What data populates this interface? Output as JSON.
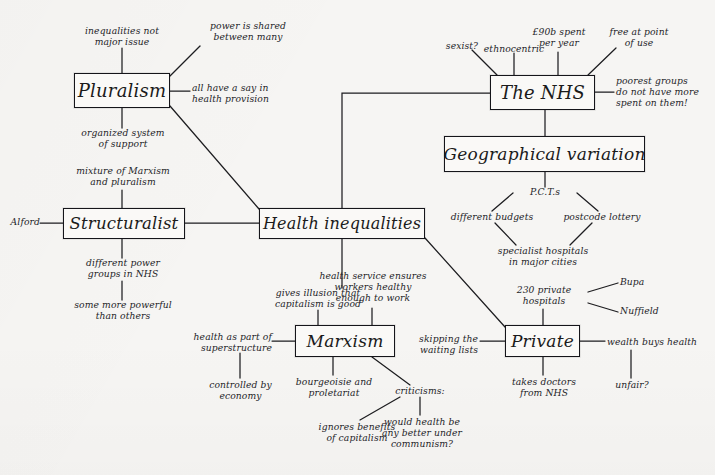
{
  "palette": {
    "paper": "#f6f5f3",
    "ink": "#1b1b1b",
    "box_fill": "#faf9f7",
    "box_border": "#15151a"
  },
  "boxes": [
    {
      "id": "pluralism",
      "label": "Pluralism"
    },
    {
      "id": "structuralist",
      "label": "Structuralist"
    },
    {
      "id": "health",
      "label": "Health inequalities"
    },
    {
      "id": "nhs",
      "label": "The NHS"
    },
    {
      "id": "geographical",
      "label": "Geographical variation"
    },
    {
      "id": "marxism",
      "label": "Marxism"
    },
    {
      "id": "private",
      "label": "Private"
    }
  ],
  "notes": {
    "inequalities_not_major": "inequalities not\nmajor issue",
    "power_shared": "power is shared\nbetween many",
    "all_have_say": "all have a say in\nhealth provision",
    "organized_system": "organized system\nof support",
    "mixture_marxism": "mixture of Marxism\nand pluralism",
    "alford": "Alford",
    "different_power_groups": "different power\ngroups in NHS",
    "some_more_powerful": "some more powerful\nthan others",
    "sexist": "sexist?",
    "ethnocentric": "ethnocentric",
    "spend_per_year": "£90b spent\nper year",
    "free_at_point": "free at point\nof use",
    "poorest_groups": "poorest groups\ndo not have more\nspent on them!",
    "pcts": "P.C.T.s",
    "different_budgets": "different budgets",
    "postcode_lottery": "postcode lottery",
    "specialist_hospitals": "specialist hospitals\nin major cities",
    "private_hospitals": "230 private\nhospitals",
    "bupa": "Bupa",
    "nuffield": "Nuffield",
    "wealth_buys_health": "wealth buys health",
    "unfair": "unfair?",
    "skipping_waiting": "skipping the\nwaiting lists",
    "takes_doctors": "takes doctors\nfrom NHS",
    "gives_illusion": "gives illusion that\ncapitalism is good",
    "health_service_ensures": "health service ensures\nworkers healthy\nenough to work",
    "health_as_part": "health as part of\nsuperstructure",
    "controlled_by_economy": "controlled by\neconomy",
    "bourgeoisie": "bourgeoisie and\nproletariat",
    "criticisms": "criticisms:",
    "ignores_benefits": "ignores benefits\nof capitalism",
    "would_health_be": "would health be\nany better under\ncommunism?"
  }
}
